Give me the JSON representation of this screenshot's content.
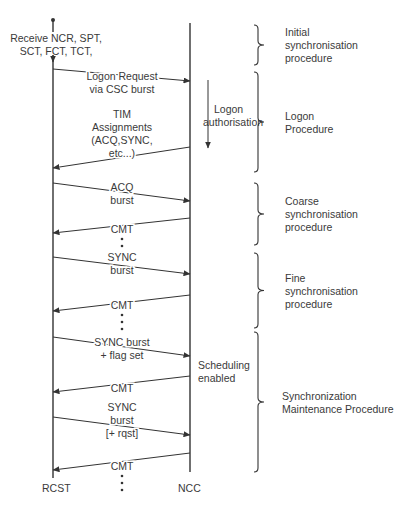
{
  "lifelines": {
    "rcst": "RCST",
    "ncc": "NCC"
  },
  "start_note": [
    "Receive NCR, SPT,",
    "SCT, FCT, TCT,"
  ],
  "ncc_notes": [
    {
      "id": "logon-authorisation",
      "lines": [
        "Logon",
        "authorisation"
      ],
      "has_arrow": true
    },
    {
      "id": "scheduling-enabled",
      "lines": [
        "Scheduling",
        "enabled"
      ],
      "has_arrow": false
    }
  ],
  "messages": [
    {
      "id": "logon-request",
      "direction": "to-ncc",
      "lines": [
        "Logon Request",
        "via CSC  burst"
      ]
    },
    {
      "id": "tim-assignments",
      "direction": "to-rcst",
      "lines": [
        "TIM",
        "Assignments",
        "(ACQ,SYNC,",
        "etc...)"
      ]
    },
    {
      "id": "acq-burst",
      "direction": "to-ncc",
      "lines": [
        "ACQ",
        "burst"
      ]
    },
    {
      "id": "cmt-1",
      "direction": "to-rcst",
      "lines": [
        "CMT"
      ],
      "ellipsis_after": true
    },
    {
      "id": "sync-burst-1",
      "direction": "to-ncc",
      "lines": [
        "SYNC",
        "burst"
      ]
    },
    {
      "id": "cmt-2",
      "direction": "to-rcst",
      "lines": [
        "CMT"
      ],
      "ellipsis_after": true
    },
    {
      "id": "sync-burst-flag",
      "direction": "to-ncc",
      "lines": [
        "SYNC burst",
        "+ flag set"
      ]
    },
    {
      "id": "cmt-3",
      "direction": "to-rcst",
      "lines": [
        "CMT"
      ]
    },
    {
      "id": "sync-burst-rqst",
      "direction": "to-ncc",
      "lines": [
        "SYNC",
        "burst",
        "[+ rqst]"
      ]
    },
    {
      "id": "cmt-4",
      "direction": "to-rcst",
      "lines": [
        "CMT"
      ],
      "ellipsis_after": true
    }
  ],
  "procedures": [
    {
      "id": "initial-sync",
      "lines": [
        "Initial",
        "synchronisation",
        "procedure"
      ]
    },
    {
      "id": "logon",
      "lines": [
        "Logon",
        "Procedure"
      ]
    },
    {
      "id": "coarse-sync",
      "lines": [
        "Coarse",
        "synchronisation",
        "procedure"
      ]
    },
    {
      "id": "fine-sync",
      "lines": [
        "Fine",
        "synchronisation",
        "procedure"
      ]
    },
    {
      "id": "sync-maintenance",
      "lines": [
        "Synchronization",
        "Maintenance Procedure"
      ]
    }
  ],
  "colors": {
    "ink": "#333333",
    "text": "#3a3a3a",
    "background": "#ffffff"
  }
}
